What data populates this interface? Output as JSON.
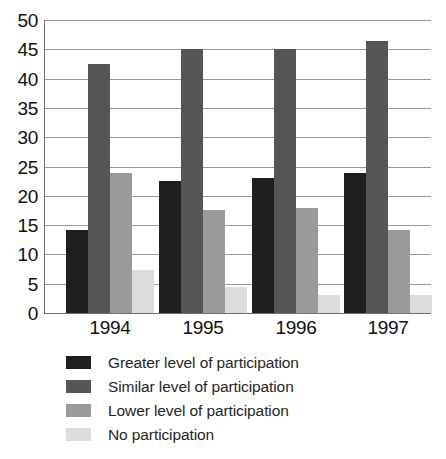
{
  "chart_data": {
    "type": "bar",
    "title": "",
    "subtitle": "",
    "xlabel": "",
    "ylabel": "",
    "categories": [
      "1994",
      "1995",
      "1996",
      "1997"
    ],
    "ylim": [
      0,
      50
    ],
    "y_ticks": [
      0,
      5,
      10,
      15,
      20,
      25,
      30,
      35,
      40,
      45,
      50
    ],
    "grid": "horizontal",
    "legend_position": "bottom-left",
    "series": [
      {
        "name": "Greater level of participation",
        "color": "#1f1f1f",
        "values": [
          14.2,
          22.6,
          23.0,
          23.9
        ]
      },
      {
        "name": "Similar level of participation",
        "color": "#555555",
        "values": [
          42.5,
          45.1,
          45.1,
          46.5
        ]
      },
      {
        "name": "Lower level of participation",
        "color": "#9a9a9a",
        "values": [
          23.9,
          17.5,
          18.0,
          14.1
        ]
      },
      {
        "name": "No participation",
        "color": "#dcdcdc",
        "values": [
          7.4,
          4.5,
          3.1,
          3.0
        ]
      }
    ]
  },
  "axis": {
    "y_tick_labels": [
      "50",
      "45",
      "40",
      "35",
      "30",
      "25",
      "20",
      "15",
      "10",
      "5",
      "0"
    ],
    "x_tick_labels": [
      "1994",
      "1995",
      "1996",
      "1997"
    ]
  },
  "legend": {
    "items": [
      {
        "label": "Greater level of participation",
        "color": "#1f1f1f"
      },
      {
        "label": "Similar level of participation",
        "color": "#555555"
      },
      {
        "label": "Lower level of participation",
        "color": "#9a9a9a"
      },
      {
        "label": "No participation",
        "color": "#dcdcdc"
      }
    ]
  },
  "colors": {
    "grid": "#9a9a9a",
    "axis": "#6f6f6f",
    "text": "#1a1a1a",
    "background": "#ffffff"
  }
}
